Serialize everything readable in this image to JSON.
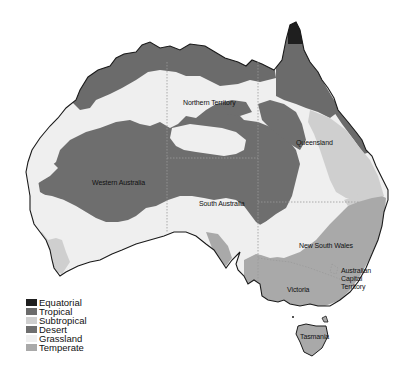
{
  "map": {
    "title": "",
    "legend": [
      {
        "label": "Equatorial",
        "color": "#1f1f1f"
      },
      {
        "label": "Tropical",
        "color": "#6b6b6b"
      },
      {
        "label": "Subtropical",
        "color": "#cfcfcf"
      },
      {
        "label": "Desert",
        "color": "#6e6e6e"
      },
      {
        "label": "Grassland",
        "color": "#efefef"
      },
      {
        "label": "Temperate",
        "color": "#a9a9a9"
      }
    ],
    "regions": {
      "northern_territory": "Northern Territory",
      "queensland": "Queensland",
      "western_australia": "Western Australia",
      "south_australia": "South Australia",
      "new_south_wales": "New South Wales",
      "act_line1": "Australian",
      "act_line2": "Capital",
      "act_line3": "Territory",
      "victoria": "Victoria",
      "tasmania": "Tasmania"
    }
  }
}
